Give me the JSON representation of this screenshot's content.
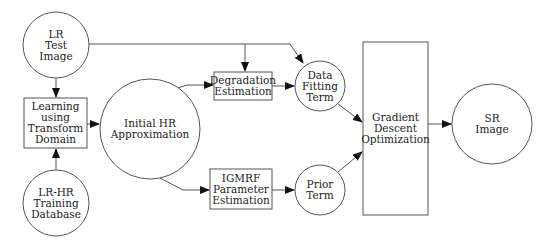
{
  "diagram": {
    "type": "flowchart",
    "colors": {
      "stroke": "#555555",
      "text": "#222222",
      "background": "#ffffff"
    },
    "nodes": {
      "lr_test_image": {
        "shape": "circle",
        "lines": [
          "LR",
          "Test",
          "Image"
        ]
      },
      "learning": {
        "shape": "rect",
        "lines": [
          "Learning",
          "using",
          "Transform",
          "Domain"
        ]
      },
      "lr_hr_db": {
        "shape": "circle",
        "lines": [
          "LR-HR",
          "Training",
          "Database"
        ]
      },
      "initial_hr": {
        "shape": "circle",
        "lines": [
          "Initial HR",
          "Approximation"
        ]
      },
      "degradation": {
        "shape": "rect",
        "lines": [
          "Degradation",
          "Estimation"
        ]
      },
      "igmrf": {
        "shape": "rect",
        "lines": [
          "IGMRF",
          "Parameter",
          "Estimation"
        ]
      },
      "data_fitting": {
        "shape": "circle",
        "lines": [
          "Data",
          "Fitting",
          "Term"
        ]
      },
      "prior": {
        "shape": "circle",
        "lines": [
          "Prior",
          "Term"
        ]
      },
      "gradient": {
        "shape": "rect",
        "lines": [
          "Gradient",
          "Descent",
          "Optimization"
        ]
      },
      "sr_image": {
        "shape": "circle",
        "lines": [
          "SR",
          "Image"
        ]
      }
    },
    "edges": [
      {
        "from": "lr_test_image",
        "to": "learning"
      },
      {
        "from": "lr_hr_db",
        "to": "learning"
      },
      {
        "from": "learning",
        "to": "initial_hr"
      },
      {
        "from": "initial_hr",
        "to": "degradation"
      },
      {
        "from": "initial_hr",
        "to": "igmrf"
      },
      {
        "from": "lr_test_image",
        "to": "degradation"
      },
      {
        "from": "lr_test_image",
        "to": "data_fitting"
      },
      {
        "from": "degradation",
        "to": "data_fitting"
      },
      {
        "from": "igmrf",
        "to": "prior"
      },
      {
        "from": "data_fitting",
        "to": "gradient"
      },
      {
        "from": "prior",
        "to": "gradient"
      },
      {
        "from": "gradient",
        "to": "sr_image"
      }
    ]
  }
}
